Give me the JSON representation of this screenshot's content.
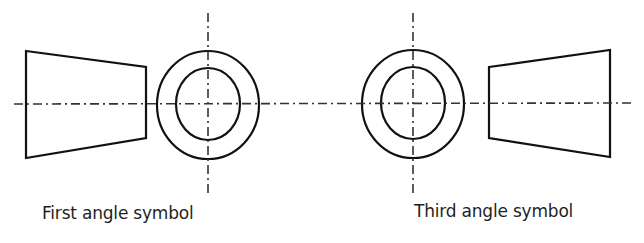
{
  "diagram": {
    "stroke_color": "#111111",
    "centerline_color": "#333333",
    "symbols": [
      {
        "label": "First angle symbol",
        "trapezoid": [
          [
            26,
            51
          ],
          [
            146,
            67
          ],
          [
            146,
            138
          ],
          [
            26,
            158
          ]
        ],
        "circle_center": [
          208,
          105
        ],
        "outer_radius": [
          51,
          54
        ],
        "inner_radius": [
          32,
          36
        ]
      },
      {
        "label": "Third angle symbol",
        "trapezoid": [
          [
            489,
            67
          ],
          [
            610,
            50
          ],
          [
            610,
            157
          ],
          [
            489,
            138
          ]
        ],
        "circle_center": [
          413,
          104
        ],
        "outer_radius": [
          51,
          54
        ],
        "inner_radius": [
          32,
          36
        ]
      }
    ]
  }
}
